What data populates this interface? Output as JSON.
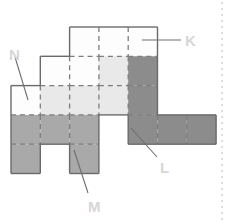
{
  "figure": {
    "background_color": "#ffffff",
    "cell_size": 29.3,
    "origin": {
      "x": 11,
      "y": 27
    },
    "colors": {
      "white": "#fdfdfd",
      "light_gray": "#e9e9e9",
      "mid_gray": "#a9a9a9",
      "dark_gray": "#8c8c8c",
      "outline": "#6a6a6a",
      "inner_dashed": "#7d7d7d",
      "leader_line": "#6e6e6e",
      "label_text": "#d6d6d6",
      "margin_dots": "#c9c9c9"
    },
    "cells": [
      {
        "id": "r1c3",
        "col": 2,
        "row": 0,
        "fill": "white"
      },
      {
        "id": "r1c4",
        "col": 3,
        "row": 0,
        "fill": "white"
      },
      {
        "id": "r1c5",
        "col": 4,
        "row": 0,
        "fill": "white"
      },
      {
        "id": "r2c2",
        "col": 1,
        "row": 1,
        "fill": "white"
      },
      {
        "id": "r2c3",
        "col": 2,
        "row": 1,
        "fill": "white"
      },
      {
        "id": "r2c4",
        "col": 3,
        "row": 1,
        "fill": "light_gray"
      },
      {
        "id": "r2c5",
        "col": 4,
        "row": 1,
        "fill": "dark_gray"
      },
      {
        "id": "r3c1",
        "col": 0,
        "row": 2,
        "fill": "white"
      },
      {
        "id": "r3c2",
        "col": 1,
        "row": 2,
        "fill": "light_gray"
      },
      {
        "id": "r3c3",
        "col": 2,
        "row": 2,
        "fill": "light_gray"
      },
      {
        "id": "r3c4",
        "col": 3,
        "row": 2,
        "fill": "light_gray"
      },
      {
        "id": "r3c5",
        "col": 4,
        "row": 2,
        "fill": "dark_gray"
      },
      {
        "id": "r4c1",
        "col": 0,
        "row": 3,
        "fill": "mid_gray"
      },
      {
        "id": "r4c2",
        "col": 1,
        "row": 3,
        "fill": "mid_gray"
      },
      {
        "id": "r4c3",
        "col": 2,
        "row": 3,
        "fill": "mid_gray"
      },
      {
        "id": "r4c5",
        "col": 4,
        "row": 3,
        "fill": "dark_gray"
      },
      {
        "id": "r4c6",
        "col": 5,
        "row": 3,
        "fill": "dark_gray"
      },
      {
        "id": "r4c7",
        "col": 6,
        "row": 3,
        "fill": "dark_gray"
      },
      {
        "id": "r5c1",
        "col": 0,
        "row": 4,
        "fill": "mid_gray"
      },
      {
        "id": "r5c3",
        "col": 2,
        "row": 4,
        "fill": "mid_gray"
      }
    ],
    "labels": [
      {
        "id": "K",
        "text": "K",
        "x": 185,
        "y": 33
      },
      {
        "id": "N",
        "text": "N",
        "x": 9,
        "y": 47
      },
      {
        "id": "L",
        "text": "L",
        "x": 160,
        "y": 160
      },
      {
        "id": "M",
        "text": "M",
        "x": 88,
        "y": 199
      }
    ],
    "leader_lines": [
      {
        "id": "leader-K",
        "x1": 181,
        "y1": 40,
        "x2": 142,
        "y2": 40
      },
      {
        "id": "leader-N",
        "x1": 15,
        "y1": 57,
        "x2": 28,
        "y2": 100
      },
      {
        "id": "leader-L",
        "x1": 157,
        "y1": 157,
        "x2": 131,
        "y2": 128
      },
      {
        "id": "leader-M",
        "x1": 88,
        "y1": 193,
        "x2": 74,
        "y2": 150
      }
    ],
    "margin_rule": {
      "id": "page-margin",
      "x": 222,
      "y_start": 2,
      "y_end": 222
    }
  }
}
